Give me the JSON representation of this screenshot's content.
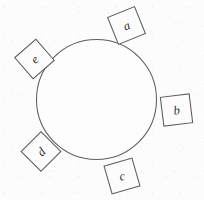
{
  "figure": {
    "background_color": "#fcfcfc",
    "stroke_color": "#5d5d61",
    "text_color": "#2c2c30",
    "canvas": {
      "width": 204,
      "height": 200
    },
    "circle": {
      "name": "central-circle",
      "cx": 96.5,
      "cy": 99.5,
      "r": 60,
      "stroke_width": 1.05,
      "fill": "#fdfdfd"
    },
    "squares": [
      {
        "id": "a",
        "label": "a",
        "cx": 126.5,
        "cy": 25.5,
        "side": 29,
        "rotation_deg": -22,
        "text_dx": 0,
        "text_dy": 0.5
      },
      {
        "id": "b",
        "label": "b",
        "cx": 176.5,
        "cy": 110.0,
        "side": 29,
        "rotation_deg": -7,
        "text_dx": 0,
        "text_dy": 0.5
      },
      {
        "id": "c",
        "label": "c",
        "cx": 122.0,
        "cy": 176.0,
        "side": 29,
        "rotation_deg": -16,
        "text_dx": 0,
        "text_dy": 0.5
      },
      {
        "id": "d",
        "label": "d",
        "cx": 41.0,
        "cy": 151.5,
        "side": 28,
        "rotation_deg": -45,
        "text_dx": 0,
        "text_dy": 0.5
      },
      {
        "id": "e",
        "label": "e",
        "cx": 34.5,
        "cy": 59.0,
        "side": 28,
        "rotation_deg": -41,
        "text_dx": 0,
        "text_dy": 0.5
      }
    ]
  }
}
